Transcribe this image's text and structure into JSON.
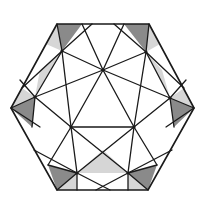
{
  "diagram": {
    "colors": {
      "stroke": "#1a1a1a",
      "dark_shade": "#8a8a8a",
      "light_shade": "#d6d6d6",
      "background": "#ffffff"
    },
    "hexagon": [
      [
        57,
        24
      ],
      [
        149,
        24
      ],
      [
        194,
        108
      ],
      [
        148,
        190
      ],
      [
        57,
        190
      ],
      [
        11,
        108
      ]
    ],
    "nodes": {
      "C": [
        103,
        70
      ],
      "UL": [
        62,
        51
      ],
      "UR": [
        146,
        52
      ],
      "ML": [
        35,
        97
      ],
      "MR": [
        170,
        98
      ],
      "CL": [
        71,
        127
      ],
      "CR": [
        134,
        127
      ],
      "BL": [
        77,
        173
      ],
      "BR": [
        128,
        173
      ]
    },
    "dark_regions": [
      [
        [
          57,
          24
        ],
        [
          82,
          24
        ],
        [
          62,
          51
        ]
      ],
      [
        [
          124,
          24
        ],
        [
          149,
          24
        ],
        [
          146,
          52
        ]
      ],
      [
        [
          11,
          108
        ],
        [
          35,
          97
        ],
        [
          32,
          127
        ]
      ],
      [
        [
          194,
          108
        ],
        [
          170,
          98
        ],
        [
          174,
          127
        ]
      ],
      [
        [
          48,
          165
        ],
        [
          77,
          173
        ],
        [
          57,
          190
        ]
      ],
      [
        [
          157,
          165
        ],
        [
          128,
          173
        ],
        [
          148,
          190
        ]
      ]
    ],
    "light_regions": [
      [
        [
          57,
          24
        ],
        [
          62,
          51
        ],
        [
          46,
          44
        ]
      ],
      [
        [
          149,
          24
        ],
        [
          146,
          52
        ],
        [
          160,
          44
        ]
      ],
      [
        [
          62,
          51
        ],
        [
          35,
          97
        ],
        [
          40,
          70
        ]
      ],
      [
        [
          146,
          52
        ],
        [
          170,
          98
        ],
        [
          162,
          70
        ]
      ],
      [
        [
          11,
          108
        ],
        [
          35,
          97
        ],
        [
          22,
          88
        ]
      ],
      [
        [
          194,
          108
        ],
        [
          170,
          98
        ],
        [
          184,
          88
        ]
      ],
      [
        [
          77,
          173
        ],
        [
          57,
          190
        ],
        [
          77,
          190
        ]
      ],
      [
        [
          128,
          173
        ],
        [
          148,
          190
        ],
        [
          128,
          190
        ]
      ],
      [
        [
          77,
          173
        ],
        [
          128,
          173
        ],
        [
          103,
          150
        ]
      ]
    ],
    "edges": [
      [
        [
          103,
          70
        ],
        [
          62,
          51
        ]
      ],
      [
        [
          103,
          70
        ],
        [
          146,
          52
        ]
      ],
      [
        [
          103,
          70
        ],
        [
          71,
          127
        ]
      ],
      [
        [
          103,
          70
        ],
        [
          134,
          127
        ]
      ],
      [
        [
          103,
          70
        ],
        [
          35,
          97
        ]
      ],
      [
        [
          103,
          70
        ],
        [
          170,
          98
        ]
      ],
      [
        [
          103,
          70
        ],
        [
          82,
          24
        ]
      ],
      [
        [
          103,
          70
        ],
        [
          124,
          24
        ]
      ],
      [
        [
          62,
          51
        ],
        [
          35,
          97
        ]
      ],
      [
        [
          146,
          52
        ],
        [
          170,
          98
        ]
      ],
      [
        [
          62,
          51
        ],
        [
          71,
          127
        ]
      ],
      [
        [
          146,
          52
        ],
        [
          134,
          127
        ]
      ],
      [
        [
          62,
          51
        ],
        [
          57,
          24
        ]
      ],
      [
        [
          146,
          52
        ],
        [
          149,
          24
        ]
      ],
      [
        [
          62,
          51
        ],
        [
          92,
          24
        ]
      ],
      [
        [
          146,
          52
        ],
        [
          114,
          24
        ]
      ],
      [
        [
          62,
          51
        ],
        [
          22,
          88
        ]
      ],
      [
        [
          146,
          52
        ],
        [
          184,
          88
        ]
      ],
      [
        [
          35,
          97
        ],
        [
          11,
          108
        ]
      ],
      [
        [
          170,
          98
        ],
        [
          194,
          108
        ]
      ],
      [
        [
          35,
          97
        ],
        [
          71,
          127
        ]
      ],
      [
        [
          170,
          98
        ],
        [
          134,
          127
        ]
      ],
      [
        [
          35,
          97
        ],
        [
          32,
          127
        ]
      ],
      [
        [
          170,
          98
        ],
        [
          174,
          127
        ]
      ],
      [
        [
          35,
          97
        ],
        [
          20,
          80
        ]
      ],
      [
        [
          170,
          98
        ],
        [
          186,
          80
        ]
      ],
      [
        [
          71,
          127
        ],
        [
          134,
          127
        ]
      ],
      [
        [
          11,
          108
        ],
        [
          40,
          127
        ]
      ],
      [
        [
          194,
          108
        ],
        [
          166,
          127
        ]
      ],
      [
        [
          71,
          127
        ],
        [
          77,
          173
        ]
      ],
      [
        [
          134,
          127
        ],
        [
          128,
          173
        ]
      ],
      [
        [
          71,
          127
        ],
        [
          128,
          173
        ]
      ],
      [
        [
          134,
          127
        ],
        [
          77,
          173
        ]
      ],
      [
        [
          71,
          127
        ],
        [
          48,
          165
        ]
      ],
      [
        [
          134,
          127
        ],
        [
          157,
          165
        ]
      ],
      [
        [
          77,
          173
        ],
        [
          48,
          165
        ]
      ],
      [
        [
          128,
          173
        ],
        [
          157,
          165
        ]
      ],
      [
        [
          77,
          173
        ],
        [
          57,
          190
        ]
      ],
      [
        [
          128,
          173
        ],
        [
          148,
          190
        ]
      ],
      [
        [
          77,
          173
        ],
        [
          77,
          190
        ]
      ],
      [
        [
          128,
          173
        ],
        [
          128,
          190
        ]
      ],
      [
        [
          77,
          173
        ],
        [
          110,
          190
        ]
      ],
      [
        [
          128,
          173
        ],
        [
          96,
          190
        ]
      ],
      [
        [
          77,
          173
        ],
        [
          34,
          150
        ]
      ],
      [
        [
          128,
          173
        ],
        [
          172,
          150
        ]
      ]
    ]
  }
}
